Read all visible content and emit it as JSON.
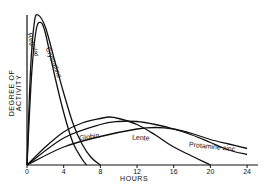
{
  "chart_data": {
    "type": "line",
    "title": "",
    "xlabel": "HOURS",
    "ylabel": "DEGREE OF ACTIVITY",
    "xlim": [
      0,
      25
    ],
    "ylim": [
      0,
      100
    ],
    "x_ticks": [
      "0",
      "4",
      "8",
      "12",
      "16",
      "20",
      "24"
    ],
    "grid": false,
    "legend": "inline labels on curves",
    "series": [
      {
        "name": "Regular",
        "x": [
          0,
          0.5,
          1,
          1.5,
          2,
          3,
          4,
          5,
          6,
          6.5
        ],
        "values": [
          0,
          60,
          90,
          95,
          88,
          60,
          35,
          15,
          4,
          0
        ]
      },
      {
        "name": "Crystalline",
        "x": [
          0,
          0.4,
          0.8,
          1.2,
          2,
          3,
          4,
          5,
          6,
          7,
          8
        ],
        "values": [
          0,
          65,
          95,
          100,
          92,
          70,
          48,
          28,
          14,
          5,
          0
        ]
      },
      {
        "name": "Globin",
        "x": [
          0,
          2,
          4,
          6,
          8,
          9,
          10,
          12,
          14,
          16,
          20
        ],
        "values": [
          0,
          12,
          22,
          28,
          31,
          32,
          31,
          27,
          20,
          12,
          0
        ]
      },
      {
        "name": "Lente",
        "x": [
          0,
          4,
          8,
          10,
          12,
          14,
          16,
          18,
          20,
          22,
          24
        ],
        "values": [
          0,
          18,
          27,
          29,
          29,
          27,
          24,
          20,
          15,
          10,
          7
        ]
      },
      {
        "name": "Protamine zinc",
        "x": [
          0,
          4,
          8,
          12,
          14,
          16,
          18,
          20,
          22,
          24
        ],
        "values": [
          0,
          12,
          19,
          24,
          25,
          24,
          21,
          17,
          14,
          11
        ]
      }
    ],
    "annotations": [
      "Regular",
      "Crystalline",
      "Globin",
      "Lente",
      "Protamine zinc"
    ]
  },
  "labels": {
    "regular": "Regular",
    "crystalline": "Crystalline",
    "globin": "Globin",
    "lente": "Lente",
    "protamine": "Protamine zinc",
    "xlabel": "HOURS",
    "ylabel": "DEGREE OF ACTIVITY",
    "ticks": [
      "0",
      "4",
      "8",
      "12",
      "16",
      "20",
      "24"
    ]
  }
}
